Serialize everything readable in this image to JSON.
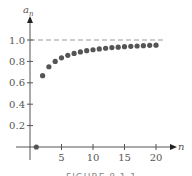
{
  "chart_data": {
    "type": "scatter",
    "title": "",
    "xlabel": "n",
    "ylabel": "a_n",
    "ylabel_main": "a",
    "ylabel_sub": "n",
    "x": [
      1,
      2,
      3,
      4,
      5,
      6,
      7,
      8,
      9,
      10,
      11,
      12,
      13,
      14,
      15,
      16,
      17,
      18,
      19,
      20
    ],
    "values": [
      0,
      0.667,
      0.75,
      0.8,
      0.833,
      0.857,
      0.875,
      0.889,
      0.9,
      0.909,
      0.917,
      0.923,
      0.929,
      0.933,
      0.938,
      0.941,
      0.944,
      0.947,
      0.95,
      0.952
    ],
    "xlim": [
      0,
      21
    ],
    "ylim": [
      0,
      1.1
    ],
    "xticks": [
      "5",
      "10",
      "15",
      "20"
    ],
    "xtick_values": [
      5,
      10,
      15,
      20
    ],
    "yticks": [
      "0.2",
      "0.4",
      "0.6",
      "0.8",
      "1.0"
    ],
    "ytick_values": [
      0.2,
      0.4,
      0.6,
      0.8,
      1.0
    ],
    "reference_line": {
      "y": 1.0,
      "style": "dashed"
    },
    "grid": false,
    "legend": null,
    "marker_color": "#555555"
  },
  "caption": "FIGURE 8.1.1"
}
